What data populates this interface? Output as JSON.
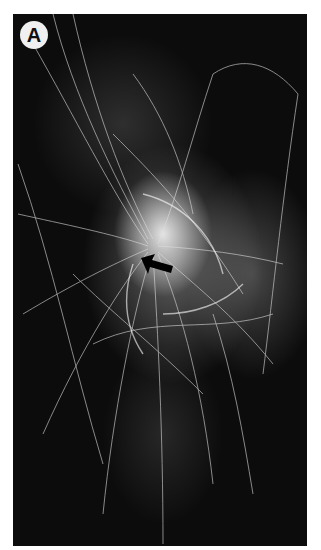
{
  "figure": {
    "panel_label": "A",
    "annotation": {
      "type": "arrow",
      "icon": "arrow-icon",
      "direction": "pointing up-left toward center"
    },
    "colors": {
      "background": "#ffffff",
      "image_background": "#0c0c0c",
      "filaments": "#e8e8e8",
      "label_circle": "#f0f0f0"
    }
  }
}
